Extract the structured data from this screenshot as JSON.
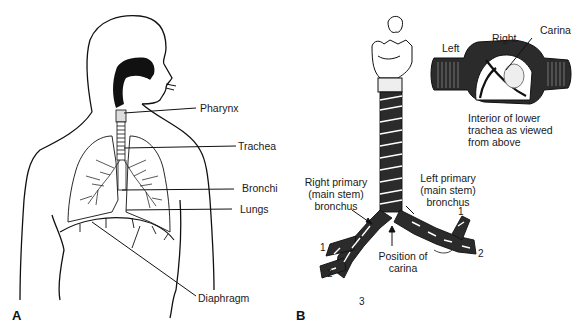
{
  "figure": {
    "panels": [
      {
        "id": "A",
        "letter": "A",
        "description": "Human torso outline showing respiratory tract",
        "labels": {
          "pharynx": "Pharynx",
          "trachea": "Trachea",
          "bronchi": "Bronchi",
          "lungs": "Lungs",
          "diaphragm": "Diaphragm"
        }
      },
      {
        "id": "B",
        "letter": "B",
        "description": "Trachea and bronchial tree with inset of carina",
        "labels": {
          "right_primary": "Right primary\n(main stem)\nbronchus",
          "left_primary": "Left primary\n(main stem)\nbronchus",
          "position_carina": "Position of\ncarina",
          "inset_left": "Left",
          "inset_right": "Right",
          "inset_carina": "Carina",
          "inset_caption": "Interior of lower\ntrachea as viewed\nfrom above"
        },
        "branch_numbers": {
          "right_1": "1",
          "right_2": "2",
          "right_3": "3",
          "left_1": "1",
          "left_2": "2"
        }
      }
    ]
  }
}
